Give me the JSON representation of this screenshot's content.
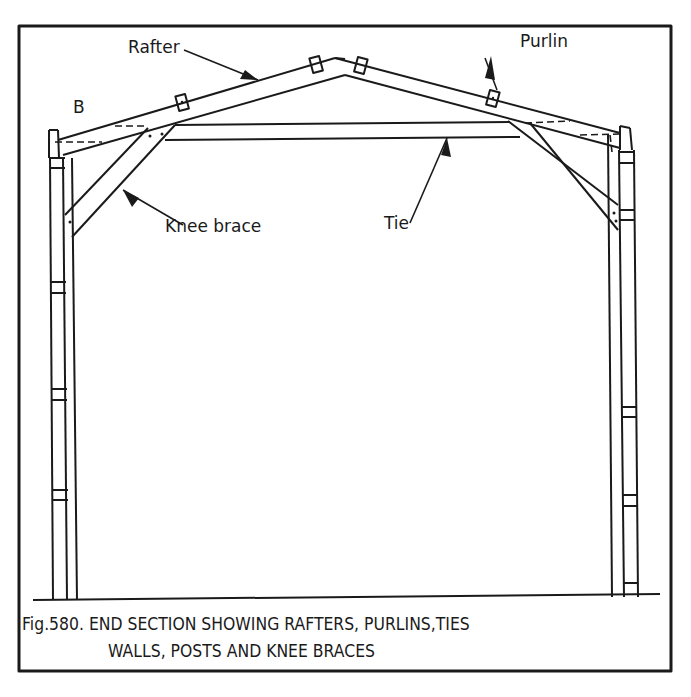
{
  "figure": {
    "labels": {
      "rafter": "Rafter",
      "purlin": "Purlin",
      "b": "B",
      "knee_brace": "Knee brace",
      "tie": "Tie"
    },
    "caption": {
      "line1": "Fig.580. END SECTION SHOWING  RAFTERS, PURLINS,TIES",
      "line2": "WALLS, POSTS AND KNEE BRACES"
    },
    "colors": {
      "ink": "#1a1a1a",
      "paper": "#ffffff"
    }
  }
}
